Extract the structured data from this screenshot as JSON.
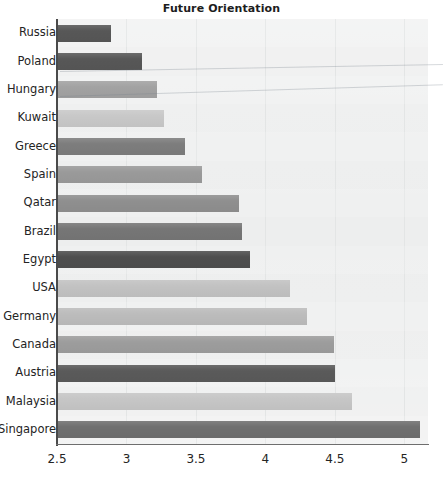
{
  "chart_data": {
    "type": "bar",
    "orientation": "horizontal",
    "title": "Future Orientation",
    "xlabel": "",
    "ylabel": "",
    "xlim": [
      2.5,
      5.17
    ],
    "xticks": [
      2.5,
      3,
      3.5,
      4,
      4.5,
      5
    ],
    "xticklabels": [
      "2.5",
      "3",
      "3.5",
      "4",
      "4.5",
      "5"
    ],
    "grid": true,
    "legend": null,
    "categories": [
      "Russia",
      "Poland",
      "Hungary",
      "Kuwait",
      "Greece",
      "Spain",
      "Qatar",
      "Brazil",
      "Egypt",
      "USA",
      "Germany",
      "Canada",
      "Austria",
      "Malaysia",
      "Singapore"
    ],
    "values": [
      2.89,
      3.11,
      3.22,
      3.27,
      3.42,
      3.54,
      3.81,
      3.83,
      3.89,
      4.18,
      4.3,
      4.49,
      4.5,
      4.62,
      5.11
    ],
    "bar_colors": [
      "#575757",
      "#575757",
      "#a2a2a2",
      "#c8c8c8",
      "#7d7d7d",
      "#9a9a9a",
      "#8f8f8f",
      "#767676",
      "#4e4e4e",
      "#c2c2c2",
      "#bcbcbc",
      "#9d9d9d",
      "#5a5a5a",
      "#c6c6c6",
      "#6f6f6f"
    ]
  },
  "colors": {
    "plot_background": "#eceded",
    "gridline": "#e2e4e4",
    "axis": "#4a4a4a",
    "text": "#242424",
    "title": "#1d1d1d"
  },
  "axis": {
    "x_tick_labels": [
      "2.5",
      "3",
      "3.5",
      "4",
      "4.5",
      "5"
    ],
    "y_tick_labels": [
      "Russia",
      "Poland",
      "Hungary",
      "Kuwait",
      "Greece",
      "Spain",
      "Qatar",
      "Brazil",
      "Egypt",
      "USA",
      "Germany",
      "Canada",
      "Austria",
      "Malaysia",
      "Singapore"
    ]
  },
  "header": {
    "title": "Future Orientation"
  }
}
